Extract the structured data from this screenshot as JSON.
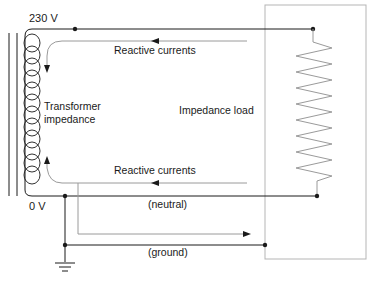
{
  "diagram": {
    "labels": {
      "source_voltage": "230 V",
      "zero_voltage": "0 V",
      "transformer": "Transformer\nimpedance",
      "transformer_line1": "Transformer",
      "transformer_line2": "impedance",
      "load": "Impedance load",
      "reactive_top": "Reactive currents",
      "reactive_bottom": "Reactive currents",
      "neutral": "(neutral)",
      "ground": "(ground)"
    },
    "components": [
      "transformer-core",
      "transformer-coil",
      "impedance-load",
      "ground-symbol"
    ],
    "connections": [
      {
        "from": "transformer-230V",
        "to": "impedance-load-top",
        "type": "line-wire"
      },
      {
        "from": "impedance-load-bottom",
        "to": "transformer-0V",
        "type": "neutral-wire"
      },
      {
        "from": "neutral-node",
        "to": "load-enclosure",
        "type": "ground-wire"
      },
      {
        "from": "neutral-node",
        "to": "earth",
        "type": "ground-connection"
      }
    ],
    "colors": {
      "wire": "#1a1a1a",
      "current_path": "#9a9a9a",
      "enclosure": "#b5b5b5",
      "resistor": "#9a9a9a"
    }
  }
}
